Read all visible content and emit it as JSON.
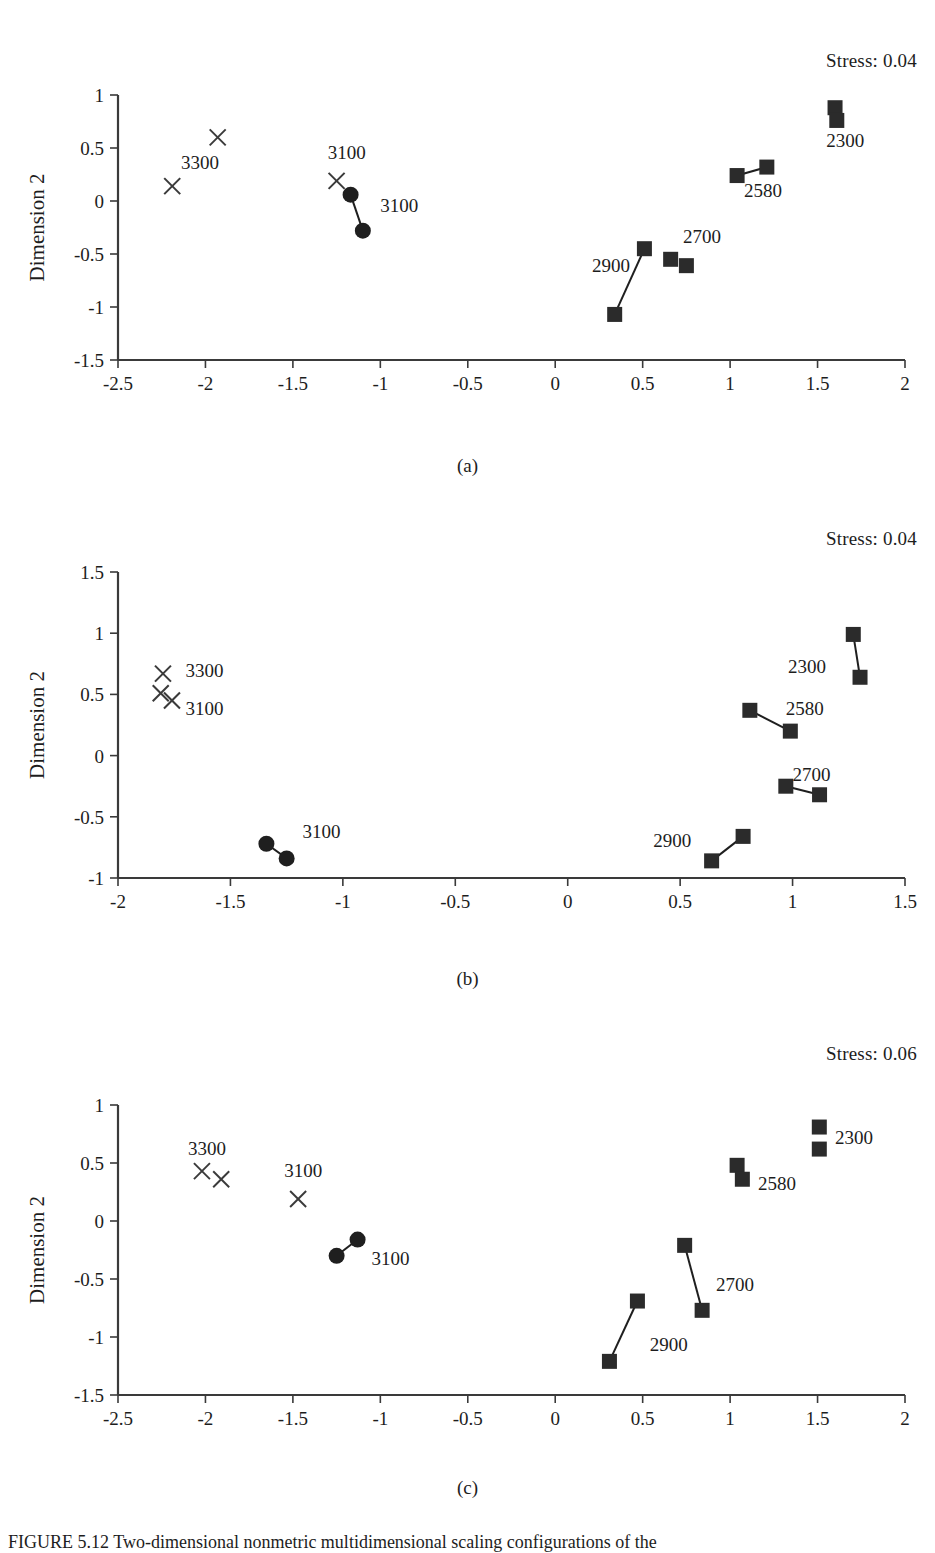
{
  "figure": {
    "caption": "FIGURE 5.12  Two-dimensional nonmetric multidimensional scaling configurations of the",
    "axis_title_y": "Dimension 2",
    "panel_letters": [
      "(a)",
      "(b)",
      "(c)"
    ]
  },
  "chart_data": [
    {
      "type": "scatter",
      "panel": "(a)",
      "title": "",
      "annotation": "Stress: 0.04",
      "stress": 0.04,
      "xlabel": "",
      "ylabel": "Dimension 2",
      "xlim": [
        -2.5,
        2
      ],
      "ylim": [
        -1.5,
        1
      ],
      "xticks": [
        "-2.5",
        "-2",
        "-1.5",
        "-1",
        "-0.5",
        "0",
        "0.5",
        "1",
        "1.5",
        "2"
      ],
      "xtick_values": [
        -2.5,
        -2,
        -1.5,
        -1,
        -0.5,
        0,
        0.5,
        1,
        1.5,
        2
      ],
      "yticks": [
        "1",
        "0.5",
        "0",
        "-0.5",
        "-1",
        "-1.5"
      ],
      "ytick_values": [
        1,
        0.5,
        0,
        -0.5,
        -1,
        -1.5
      ],
      "grid": false,
      "legend": "none",
      "groups": [
        {
          "label": "3300",
          "marker": "cross",
          "label_pos": [
            -2.14,
            0.37
          ],
          "points": [
            [
              -1.93,
              0.6
            ],
            [
              -2.19,
              0.14
            ]
          ],
          "links": []
        },
        {
          "label": "3100",
          "marker": "cross",
          "label_pos": [
            -1.3,
            0.46
          ],
          "points": [
            [
              -1.25,
              0.19
            ]
          ],
          "links": []
        },
        {
          "label": "3100",
          "marker": "circle",
          "label_pos": [
            -1.0,
            -0.04
          ],
          "points": [
            [
              -1.17,
              0.06
            ],
            [
              -1.1,
              -0.28
            ]
          ],
          "links": [
            [
              0,
              1
            ]
          ]
        },
        {
          "label": "2900",
          "marker": "square",
          "label_pos": [
            0.21,
            -0.6
          ],
          "points": [
            [
              0.51,
              -0.45
            ],
            [
              0.34,
              -1.07
            ]
          ],
          "links": [
            [
              0,
              1
            ]
          ]
        },
        {
          "label": "2700",
          "marker": "square",
          "label_pos": [
            0.73,
            -0.33
          ],
          "points": [
            [
              0.66,
              -0.55
            ],
            [
              0.75,
              -0.61
            ]
          ],
          "links": []
        },
        {
          "label": "2580",
          "marker": "square",
          "label_pos": [
            1.08,
            0.1
          ],
          "points": [
            [
              1.04,
              0.24
            ],
            [
              1.21,
              0.32
            ]
          ],
          "links": [
            [
              0,
              1
            ]
          ]
        },
        {
          "label": "2300",
          "marker": "square",
          "label_pos": [
            1.55,
            0.58
          ],
          "points": [
            [
              1.6,
              0.88
            ],
            [
              1.61,
              0.76
            ]
          ],
          "links": []
        }
      ]
    },
    {
      "type": "scatter",
      "panel": "(b)",
      "title": "",
      "annotation": "Stress: 0.04",
      "stress": 0.04,
      "xlabel": "",
      "ylabel": "Dimension 2",
      "xlim": [
        -2,
        1.5
      ],
      "ylim": [
        -1,
        1.5
      ],
      "xticks": [
        "-2",
        "-1.5",
        "-1",
        "-0.5",
        "0",
        "0.5",
        "1",
        "1.5"
      ],
      "xtick_values": [
        -2,
        -1.5,
        -1,
        -0.5,
        0,
        0.5,
        1,
        1.5
      ],
      "yticks": [
        "1.5",
        "1",
        "0.5",
        "0",
        "-0.5",
        "-1"
      ],
      "ytick_values": [
        1.5,
        1,
        0.5,
        0,
        -0.5,
        -1
      ],
      "grid": false,
      "legend": "none",
      "groups": [
        {
          "label": "3300",
          "marker": "cross",
          "label_pos": [
            -1.7,
            0.7
          ],
          "points": [
            [
              -1.8,
              0.67
            ]
          ],
          "links": []
        },
        {
          "label": "3100",
          "marker": "cross",
          "label_pos": [
            -1.7,
            0.39
          ],
          "points": [
            [
              -1.81,
              0.51
            ],
            [
              -1.76,
              0.45
            ]
          ],
          "links": []
        },
        {
          "label": "3100",
          "marker": "circle",
          "label_pos": [
            -1.18,
            -0.62
          ],
          "points": [
            [
              -1.34,
              -0.72
            ],
            [
              -1.25,
              -0.84
            ]
          ],
          "links": [
            [
              0,
              1
            ]
          ]
        },
        {
          "label": "2900",
          "marker": "square",
          "label_pos": [
            0.38,
            -0.69
          ],
          "points": [
            [
              0.78,
              -0.66
            ],
            [
              0.64,
              -0.86
            ]
          ],
          "links": [
            [
              0,
              1
            ]
          ]
        },
        {
          "label": "2700",
          "marker": "square",
          "label_pos": [
            1.0,
            -0.15
          ],
          "points": [
            [
              0.97,
              -0.25
            ],
            [
              1.12,
              -0.32
            ]
          ],
          "links": [
            [
              0,
              1
            ]
          ]
        },
        {
          "label": "2580",
          "marker": "square",
          "label_pos": [
            0.97,
            0.39
          ],
          "points": [
            [
              0.81,
              0.37
            ],
            [
              0.99,
              0.2
            ]
          ],
          "links": [
            [
              0,
              1
            ]
          ]
        },
        {
          "label": "2300",
          "marker": "square",
          "label_pos": [
            0.98,
            0.73
          ],
          "points": [
            [
              1.27,
              0.99
            ],
            [
              1.3,
              0.64
            ]
          ],
          "links": [
            [
              0,
              1
            ]
          ]
        }
      ]
    },
    {
      "type": "scatter",
      "panel": "(c)",
      "title": "",
      "annotation": "Stress: 0.06",
      "stress": 0.06,
      "xlabel": "",
      "ylabel": "Dimension 2",
      "xlim": [
        -2.5,
        2
      ],
      "ylim": [
        -1.5,
        1
      ],
      "xticks": [
        "-2.5",
        "-2",
        "-1.5",
        "-1",
        "-0.5",
        "0",
        "0.5",
        "1",
        "1.5",
        "2"
      ],
      "xtick_values": [
        -2.5,
        -2,
        -1.5,
        -1,
        -0.5,
        0,
        0.5,
        1,
        1.5,
        2
      ],
      "yticks": [
        "1",
        "0.5",
        "0",
        "-0.5",
        "-1",
        "-1.5"
      ],
      "ytick_values": [
        1,
        0.5,
        0,
        -0.5,
        -1,
        -1.5
      ],
      "grid": false,
      "legend": "none",
      "groups": [
        {
          "label": "3300",
          "marker": "cross",
          "label_pos": [
            -2.1,
            0.63
          ],
          "points": [
            [
              -2.02,
              0.43
            ],
            [
              -1.91,
              0.36
            ]
          ],
          "links": []
        },
        {
          "label": "3100",
          "marker": "cross",
          "label_pos": [
            -1.55,
            0.44
          ],
          "points": [
            [
              -1.47,
              0.19
            ]
          ],
          "links": []
        },
        {
          "label": "3100",
          "marker": "circle",
          "label_pos": [
            -1.05,
            -0.32
          ],
          "points": [
            [
              -1.13,
              -0.16
            ],
            [
              -1.25,
              -0.3
            ]
          ],
          "links": [
            [
              0,
              1
            ]
          ]
        },
        {
          "label": "2900",
          "marker": "square",
          "label_pos": [
            0.54,
            -1.06
          ],
          "points": [
            [
              0.47,
              -0.69
            ],
            [
              0.31,
              -1.21
            ]
          ],
          "links": [
            [
              0,
              1
            ]
          ]
        },
        {
          "label": "2700",
          "marker": "square",
          "label_pos": [
            0.92,
            -0.54
          ],
          "points": [
            [
              0.74,
              -0.21
            ],
            [
              0.84,
              -0.77
            ]
          ],
          "links": [
            [
              0,
              1
            ]
          ]
        },
        {
          "label": "2580",
          "marker": "square",
          "label_pos": [
            1.16,
            0.33
          ],
          "points": [
            [
              1.04,
              0.48
            ],
            [
              1.07,
              0.36
            ]
          ],
          "links": []
        },
        {
          "label": "2300",
          "marker": "square",
          "label_pos": [
            1.6,
            0.72
          ],
          "points": [
            [
              1.51,
              0.81
            ],
            [
              1.51,
              0.62
            ]
          ],
          "links": []
        }
      ]
    }
  ]
}
